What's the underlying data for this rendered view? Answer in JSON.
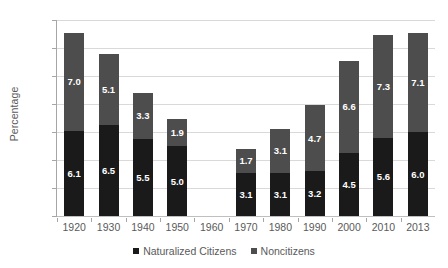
{
  "chart_data": {
    "type": "bar",
    "subtype": "stacked-vertical",
    "title": "",
    "xlabel": "",
    "ylabel": "Percentage",
    "ylim": [
      0,
      14
    ],
    "ytick_step": 2,
    "yticks": [
      "0",
      "2",
      "4",
      "6",
      "8",
      "10",
      "12",
      "14"
    ],
    "grid": "horizontal",
    "legend_position": "bottom-center",
    "categories": [
      "1920",
      "1930",
      "1940",
      "1950",
      "1960",
      "1970",
      "1980",
      "1990",
      "2000",
      "2010",
      "2013"
    ],
    "series": [
      {
        "name": "Naturalized Citizens",
        "color": "#1a1a1a",
        "values": [
          6.1,
          6.5,
          5.5,
          5.0,
          null,
          3.1,
          3.1,
          3.2,
          4.5,
          5.6,
          6.0
        ],
        "labels": [
          "6.1",
          "6.5",
          "5.5",
          "5.0",
          "",
          "3.1",
          "3.1",
          "3.2",
          "4.5",
          "5.6",
          "6.0"
        ]
      },
      {
        "name": "Noncitizens",
        "color": "#4d4d4d",
        "values": [
          7.0,
          5.1,
          3.3,
          1.9,
          null,
          1.7,
          3.1,
          4.7,
          6.6,
          7.3,
          7.1
        ],
        "labels": [
          "7.0",
          "5.1",
          "3.3",
          "1.9",
          "",
          "1.7",
          "3.1",
          "4.7",
          "6.6",
          "7.3",
          "7.1"
        ]
      }
    ],
    "totals": [
      13.1,
      11.6,
      8.8,
      6.9,
      null,
      4.8,
      6.2,
      7.9,
      11.1,
      12.9,
      13.1
    ],
    "legend": [
      {
        "label": "Naturalized Citizens",
        "swatch": "#1a1a1a"
      },
      {
        "label": "Noncitizens",
        "swatch": "#4d4d4d"
      }
    ],
    "colors": {
      "naturalized": "#1a1a1a",
      "noncitizens": "#4d4d4d",
      "gridline": "#d9d9d9",
      "axis": "#a6a6a6",
      "text": "#5a5a5a",
      "background": "#ffffff"
    }
  }
}
